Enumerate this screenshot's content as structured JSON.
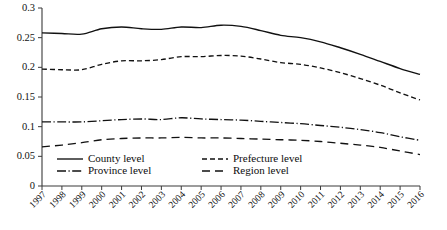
{
  "chart_data": {
    "type": "line",
    "title": "",
    "subtitle": "",
    "xlabel": "",
    "ylabel": "",
    "x": [
      1997,
      1998,
      1999,
      2000,
      2001,
      2002,
      2003,
      2004,
      2005,
      2006,
      2007,
      2008,
      2009,
      2010,
      2011,
      2012,
      2013,
      2014,
      2015,
      2016
    ],
    "categories": [
      "1997",
      "1998",
      "1999",
      "2000",
      "2001",
      "2002",
      "2003",
      "2004",
      "2005",
      "2006",
      "2007",
      "2008",
      "2009",
      "2010",
      "2011",
      "2012",
      "2013",
      "2014",
      "2015",
      "2016"
    ],
    "xlim": [
      1997,
      2016
    ],
    "ylim": [
      0,
      0.3
    ],
    "yticks": [
      0,
      0.05,
      0.1,
      0.15,
      0.2,
      0.25,
      0.3
    ],
    "ytick_labels": [
      "0",
      "0.05",
      "0.1",
      "0.15",
      "0.2",
      "0.25",
      "0.3"
    ],
    "grid": false,
    "legend_position": "inside-bottom-left",
    "series": [
      {
        "name": "County level",
        "style": "solid",
        "color": "#111111",
        "values": [
          0.258,
          0.257,
          0.256,
          0.265,
          0.268,
          0.265,
          0.264,
          0.268,
          0.267,
          0.271,
          0.269,
          0.262,
          0.254,
          0.25,
          0.243,
          0.233,
          0.222,
          0.21,
          0.198,
          0.188
        ]
      },
      {
        "name": "Prefecture level",
        "style": "dashed",
        "color": "#111111",
        "values": [
          0.197,
          0.196,
          0.196,
          0.205,
          0.211,
          0.211,
          0.213,
          0.218,
          0.218,
          0.22,
          0.219,
          0.214,
          0.208,
          0.205,
          0.199,
          0.191,
          0.181,
          0.17,
          0.157,
          0.145
        ]
      },
      {
        "name": "Province level",
        "style": "dashdot",
        "color": "#111111",
        "values": [
          0.108,
          0.108,
          0.108,
          0.11,
          0.112,
          0.113,
          0.112,
          0.115,
          0.113,
          0.112,
          0.111,
          0.109,
          0.107,
          0.105,
          0.102,
          0.099,
          0.095,
          0.09,
          0.083,
          0.077
        ]
      },
      {
        "name": "Region level",
        "style": "longdash",
        "color": "#111111",
        "values": [
          0.066,
          0.069,
          0.073,
          0.078,
          0.08,
          0.081,
          0.081,
          0.082,
          0.081,
          0.081,
          0.08,
          0.079,
          0.078,
          0.077,
          0.075,
          0.072,
          0.069,
          0.065,
          0.059,
          0.053
        ]
      }
    ],
    "legend": [
      {
        "label": "County level",
        "style": "solid"
      },
      {
        "label": "Prefecture level",
        "style": "dashed"
      },
      {
        "label": "Province level",
        "style": "dashdot"
      },
      {
        "label": "Region level",
        "style": "longdash"
      }
    ]
  },
  "axes": {
    "y_axis_name": "y-axis",
    "x_axis_name": "x-axis"
  }
}
